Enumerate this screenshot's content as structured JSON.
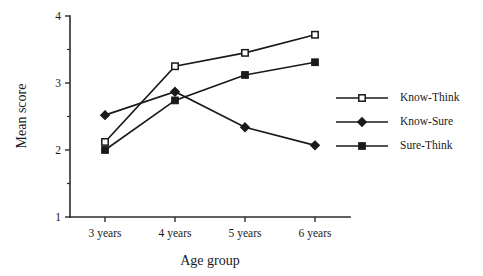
{
  "chart_data": {
    "type": "line",
    "title": "",
    "subtitle": "",
    "xlabel": "Age group",
    "ylabel": "Mean score",
    "categories": [
      "3 years",
      "4 years",
      "5 years",
      "6 years"
    ],
    "ylim": [
      1,
      4
    ],
    "yticks": [
      1,
      2,
      3,
      4
    ],
    "ytick_labels": [
      "1",
      "2",
      "3",
      "4"
    ],
    "yminor_ticks": [
      1.5,
      2.5,
      3.5
    ],
    "grid": false,
    "legend_position": "right",
    "series": [
      {
        "name": "Know-Think",
        "marker": "open-square",
        "values": [
          2.12,
          3.25,
          3.45,
          3.72
        ]
      },
      {
        "name": "Know-Sure",
        "marker": "filled-diamond",
        "values": [
          2.52,
          2.87,
          2.34,
          2.07
        ]
      },
      {
        "name": "Sure-Think",
        "marker": "filled-square",
        "values": [
          2.0,
          2.74,
          3.12,
          3.31
        ]
      }
    ]
  },
  "colors": {
    "ink": "#1a1a1a",
    "axis": "#2b2b2b",
    "background": "#ffffff",
    "marker_fill_open": "#ffffff"
  }
}
